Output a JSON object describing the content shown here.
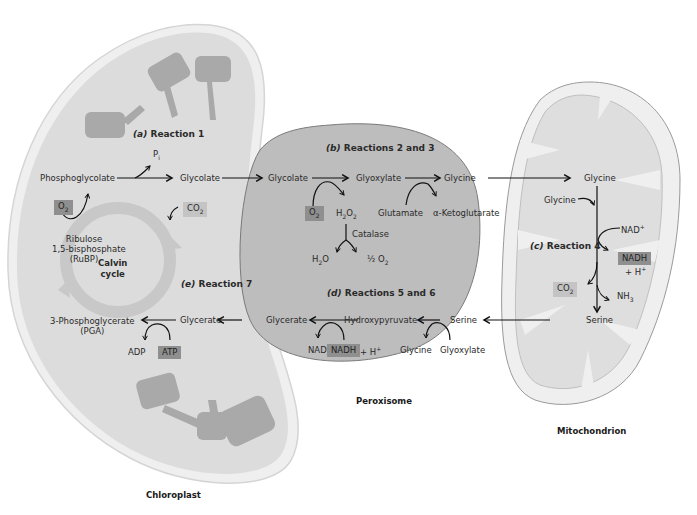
{
  "organelles": {
    "chloroplast": "Chloroplast",
    "peroxisome": "Peroxisome",
    "mitochondrion": "Mitochondrion"
  },
  "reactions": {
    "a": {
      "letter": "(a)",
      "label": "Reaction 1"
    },
    "b": {
      "letter": "(b)",
      "label": "Reactions 2 and 3"
    },
    "c": {
      "letter": "(c)",
      "label": "Reaction 4"
    },
    "d": {
      "letter": "(d)",
      "label": "Reactions 5 and 6"
    },
    "e": {
      "letter": "(e)",
      "label": "Reaction 7"
    }
  },
  "chloroplast": {
    "phosphoglycolate": "Phosphoglycolate",
    "pi": "P",
    "pi_sub": "i",
    "glycolate": "Glycolate",
    "o2": "O",
    "o2_sub": "2",
    "co2": "CO",
    "co2_sub": "2",
    "rubp_line1": "Ribulose",
    "rubp_line2": "1,5-bisphosphate",
    "rubp_line3": "(RuBP)",
    "calvin_line1": "Calvin",
    "calvin_line2": "cycle",
    "pga_line1": "3-Phosphoglycerate",
    "pga_line2": "(PGA)",
    "glycerate": "Glycerate",
    "adp": "ADP",
    "atp": "ATP"
  },
  "peroxisome": {
    "glycolate": "Glycolate",
    "glyoxylate": "Glyoxylate",
    "glycine": "Glycine",
    "o2": "O",
    "o2_sub": "2",
    "h2o2": "H",
    "glutamate": "Glutamate",
    "ketoglutarate": "α-Ketoglutarate",
    "catalase": "Catalase",
    "h2o": "H",
    "half_o2": "½ O",
    "glycerate": "Glycerate",
    "hydroxypyruvate": "Hydroxypyruvate",
    "serine": "Serine",
    "nad": "NAD",
    "nadh": "NADH",
    "h_plus": "+ H",
    "glycine2": "Glycine",
    "glyoxylate2": "Glyoxylate"
  },
  "mitochondrion": {
    "glycine_top": "Glycine",
    "glycine_in": "Glycine",
    "nad_plus": "NAD",
    "nadh": "NADH",
    "h_plus": "+ H",
    "co2": "CO",
    "co2_sub": "2",
    "nh3": "NH",
    "nh3_sub": "3",
    "serine": "Serine"
  },
  "colors": {
    "chloroplast_fill": "#dcdcdc",
    "chloroplast_rim": "#efefef",
    "peroxisome_fill": "#bdbdbd",
    "mito_fill": "#eeeeee",
    "mito_inner": "#dedede",
    "thylakoid": "#a9a9a9",
    "calvin_ring": "#c8c8c8",
    "highlight_dark": "#8f8f8f",
    "highlight_light": "#c4c4c4"
  }
}
